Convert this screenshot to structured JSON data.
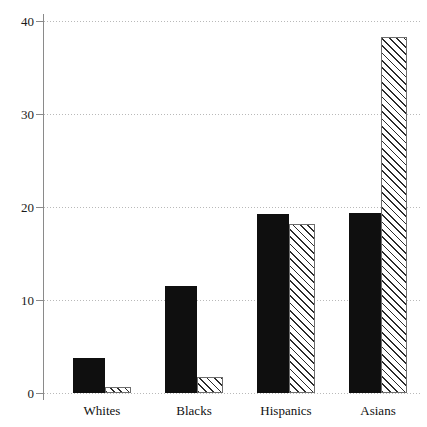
{
  "chart_data": {
    "type": "bar",
    "title": "",
    "subtitle": "",
    "xlabel": "",
    "ylabel": "",
    "categories": [
      "Whites",
      "Blacks",
      "Hispanics",
      "Asians"
    ],
    "series": [
      {
        "name": "solid-black-series",
        "style": "solid black fill",
        "values": [
          3.8,
          11.5,
          19.2,
          19.4
        ]
      },
      {
        "name": "hatched-series",
        "style": "diagonal hatch fill",
        "values": [
          0.6,
          1.7,
          18.2,
          38.3
        ]
      }
    ],
    "ylim": [
      0,
      40
    ],
    "yticks": [
      0,
      10,
      20,
      30,
      40
    ],
    "ytick_labels": [
      "0",
      "10",
      "20",
      "30",
      "40"
    ],
    "grid": true,
    "grid_style": "dotted horizontal",
    "legend": null,
    "legend_position": "none",
    "annotations": []
  },
  "axis": {
    "y_tick_labels": [
      "40",
      "30",
      "20",
      "10",
      "0"
    ],
    "x_category_labels": [
      "Whites",
      "Blacks",
      "Hispanics",
      "Asians"
    ]
  },
  "colors": {
    "solid_bar": "#0f0f0f",
    "hatch_line": "#2b2b2b",
    "hatch_background": "#ffffff",
    "hatch_border": "#6d6d6d",
    "gridline": "#b9b9b9",
    "axis_line": "#8a8a8a",
    "text": "#111111",
    "background": "#ffffff"
  }
}
